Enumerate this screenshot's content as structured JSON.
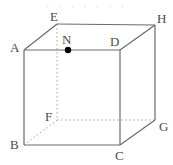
{
  "figure": {
    "type": "geometric-diagram",
    "shape": "cube",
    "projection": "oblique",
    "canvas": {
      "width": 173,
      "height": 165
    },
    "background_color": "#ffffff",
    "solid_line_color": "#6b6b6b",
    "hidden_line_color": "#a8a8a8",
    "point_marker_color": "#000000",
    "label_color": "#4a4a4a",
    "top_artifact_text": "· · · · · · ·"
  },
  "vertices": [
    {
      "id": "A",
      "label": "A",
      "x": 24,
      "y": 50,
      "label_x": 10,
      "label_y": 41,
      "hidden": false
    },
    {
      "id": "B",
      "label": "B",
      "x": 24,
      "y": 145,
      "label_x": 10,
      "label_y": 138,
      "hidden": false
    },
    {
      "id": "C",
      "label": "C",
      "x": 120,
      "y": 145,
      "label_x": 115,
      "label_y": 149,
      "hidden": false
    },
    {
      "id": "D",
      "label": "D",
      "x": 120,
      "y": 50,
      "label_x": 110,
      "label_y": 35,
      "hidden": false
    },
    {
      "id": "E",
      "label": "E",
      "x": 57,
      "y": 24,
      "label_x": 50,
      "label_y": 10,
      "hidden": false
    },
    {
      "id": "F",
      "label": "F",
      "x": 57,
      "y": 120,
      "label_x": 45,
      "label_y": 110,
      "hidden": true
    },
    {
      "id": "G",
      "label": "G",
      "x": 155,
      "y": 120,
      "label_x": 159,
      "label_y": 120,
      "hidden": false
    },
    {
      "id": "H",
      "label": "H",
      "x": 155,
      "y": 25,
      "label_x": 157,
      "label_y": 12,
      "hidden": false
    }
  ],
  "points": [
    {
      "id": "N",
      "label": "N",
      "x": 68,
      "y": 50,
      "label_x": 62,
      "label_y": 33,
      "on_edge": "AD",
      "radius": 3.2
    }
  ],
  "edges": {
    "solid": [
      {
        "from": "A",
        "to": "D",
        "name": "edge-AD"
      },
      {
        "from": "A",
        "to": "B",
        "name": "edge-AB"
      },
      {
        "from": "B",
        "to": "C",
        "name": "edge-BC"
      },
      {
        "from": "C",
        "to": "D",
        "name": "edge-CD"
      },
      {
        "from": "E",
        "to": "H",
        "name": "edge-EH"
      },
      {
        "from": "A",
        "to": "E",
        "name": "edge-AE"
      },
      {
        "from": "D",
        "to": "H",
        "name": "edge-DH"
      },
      {
        "from": "H",
        "to": "G",
        "name": "edge-HG"
      },
      {
        "from": "C",
        "to": "G",
        "name": "edge-CG"
      }
    ],
    "dashed": [
      {
        "from": "E",
        "to": "F",
        "name": "edge-EF"
      },
      {
        "from": "F",
        "to": "G",
        "name": "edge-FG"
      },
      {
        "from": "B",
        "to": "F",
        "name": "edge-BF"
      }
    ]
  }
}
